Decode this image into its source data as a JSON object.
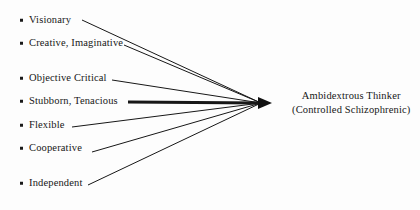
{
  "diagram": {
    "background_color": "#fdfdfd",
    "ink_color": "#171717",
    "traits": [
      {
        "label": "Visionary",
        "bullet": "square-bullet",
        "text_x": 20,
        "text_y": 20,
        "line_start_x": 82,
        "line_start_y": 20,
        "line_width": 1
      },
      {
        "label": "Creative, Imaginative",
        "bullet": "square-bullet",
        "text_x": 20,
        "text_y": 43,
        "line_start_x": 124,
        "line_start_y": 45,
        "line_width": 1
      },
      {
        "label": "Objective Critical",
        "bullet": "square-bullet",
        "text_x": 20,
        "text_y": 78,
        "line_start_x": 112,
        "line_start_y": 80,
        "line_width": 1
      },
      {
        "label": "Stubborn, Tenacious",
        "bullet": "square-bullet",
        "text_x": 20,
        "text_y": 101,
        "line_start_x": 128,
        "line_start_y": 102,
        "line_width": 3.2
      },
      {
        "label": "Flexible",
        "bullet": "square-bullet",
        "text_x": 20,
        "text_y": 125,
        "line_start_x": 72,
        "line_start_y": 127,
        "line_width": 1
      },
      {
        "label": "Cooperative",
        "bullet": "square-bullet",
        "text_x": 20,
        "text_y": 148,
        "line_start_x": 92,
        "line_start_y": 152,
        "line_width": 1
      },
      {
        "label": "Independent",
        "bullet": "square-bullet",
        "text_x": 20,
        "text_y": 183,
        "line_start_x": 88,
        "line_start_y": 185,
        "line_width": 1
      }
    ],
    "convergence": {
      "x": 272,
      "y": 103,
      "arrowhead": "solid-triangle-arrowhead",
      "arrowhead_length": 14,
      "arrowhead_half_height": 6
    },
    "target": {
      "line1": "Ambidextrous Thinker",
      "line2": "(Controlled Schizophrenic)",
      "x": 292,
      "y": 103
    }
  }
}
